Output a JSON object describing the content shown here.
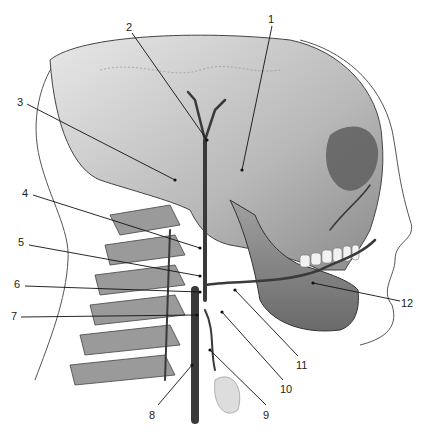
{
  "diagram": {
    "labels": [
      {
        "id": "1",
        "text": "1",
        "x": 270,
        "y": 14,
        "tx": 242,
        "ty": 170
      },
      {
        "id": "2",
        "text": "2",
        "x": 127,
        "y": 22,
        "tx": 207,
        "ty": 140
      },
      {
        "id": "3",
        "text": "3",
        "x": 18,
        "y": 99,
        "tx": 175,
        "ty": 180
      },
      {
        "id": "4",
        "text": "4",
        "x": 24,
        "y": 189,
        "tx": 200,
        "ty": 248
      },
      {
        "id": "5",
        "text": "5",
        "x": 19,
        "y": 238,
        "tx": 200,
        "ty": 276
      },
      {
        "id": "6",
        "text": "6",
        "x": 15,
        "y": 280,
        "tx": 200,
        "ty": 292
      },
      {
        "id": "7",
        "text": "7",
        "x": 12,
        "y": 312,
        "tx": 197,
        "ty": 315
      },
      {
        "id": "8",
        "text": "8",
        "x": 150,
        "y": 410,
        "tx": 192,
        "ty": 365
      },
      {
        "id": "9",
        "text": "9",
        "x": 264,
        "y": 410,
        "tx": 210,
        "ty": 350
      },
      {
        "id": "10",
        "text": "10",
        "x": 281,
        "y": 384,
        "tx": 222,
        "ty": 312
      },
      {
        "id": "11",
        "text": "11",
        "x": 297,
        "y": 360,
        "tx": 235,
        "ty": 290
      },
      {
        "id": "12",
        "text": "12",
        "x": 402,
        "y": 299,
        "tx": 313,
        "ty": 283
      }
    ]
  }
}
